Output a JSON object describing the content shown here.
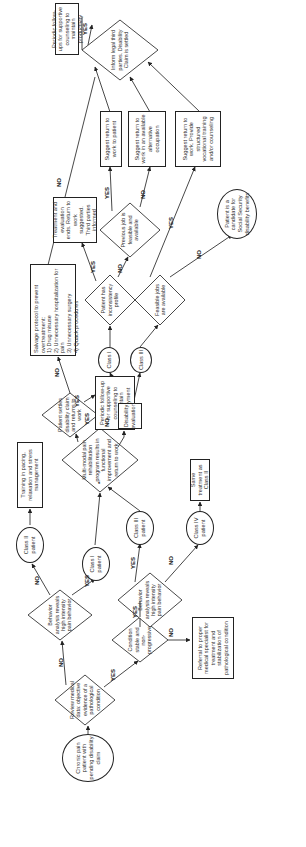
{
  "flowchart": {
    "start": "Chronic pain patient with pending disability claim",
    "review": "Review medical data: objective evidence of a pathological condition",
    "behavior1": "Behavior analysis reveals high intensity pain behavior",
    "condition": "Condition stable and non-progressive",
    "referral": "Referral to proper medical specialist for treatment and stabilization of pathological condition",
    "behavior2": "Behavior analysis reveals high intensity pain behavior",
    "class2": "Class II patient",
    "class1": "Class I patient",
    "class3": "Class III patient",
    "class4": "Class IV patient",
    "same_treatment": "Same treatment as Class II",
    "training": "Training in pacing, relaxation and stress management",
    "multimodal": "Multi-modal pain rehabilitation program results in functional improvement and return to work",
    "settles": "Patient settles disability claim and returns to work",
    "periodic_mid": "Periodic follow-up for supportive counseling to maintain employment",
    "salvage_title": "Salvage protocol to prevent overtreatment:",
    "salvage_items": [
      "1) Drug misuse",
      "2) Unnecessary hospitalization for pain",
      "3) Unnecessary surgery",
      "4) Quack procedures"
    ],
    "disability_eval": "Disability evaluation",
    "class1_small": "Class I",
    "class3_small": "Class III",
    "inconsistency": "Patient has inconsistency profile",
    "feasible": "Feasible jobs are available",
    "treatment_ends": "Treatment and evaluation ends. Return to work suggested. Third parties informed",
    "previous_job": "Previous job is feasible and available",
    "suggest_patient": "Suggest return to work to patient",
    "suggest_alt": "Suggest return to work in an available alternative occupation",
    "suggest_voc": "Suggest return to work. Provide structured vocational training and/or counseling",
    "ss_candidate": "Patient is a candidate for Social Security disability benefits",
    "inform": "Inform legal third parties. Disability Claim is settled",
    "periodic_end": "Periodic follow-ups for supportive counseling to maintain productivity",
    "yes": "YES",
    "no": "NO",
    "star": "*"
  }
}
